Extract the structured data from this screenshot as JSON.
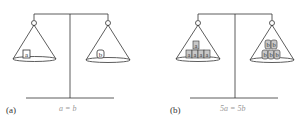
{
  "figure": {
    "panels": [
      {
        "id": "a",
        "label": "(a)",
        "equation": "a = b",
        "left_pan": {
          "blocks": [
            "a"
          ]
        },
        "right_pan": {
          "blocks": [
            "b"
          ]
        }
      },
      {
        "id": "b",
        "label": "(b)",
        "equation": "5a = 5b",
        "left_pan": {
          "blocks": [
            "a",
            "a",
            "a",
            "a",
            "a"
          ]
        },
        "right_pan": {
          "blocks": [
            "b",
            "b",
            "b",
            "b",
            "b"
          ]
        }
      }
    ],
    "colors": {
      "line": "#333333",
      "block_fill_b_panel": "#c8c8c8",
      "equation_text": "#999999"
    }
  }
}
